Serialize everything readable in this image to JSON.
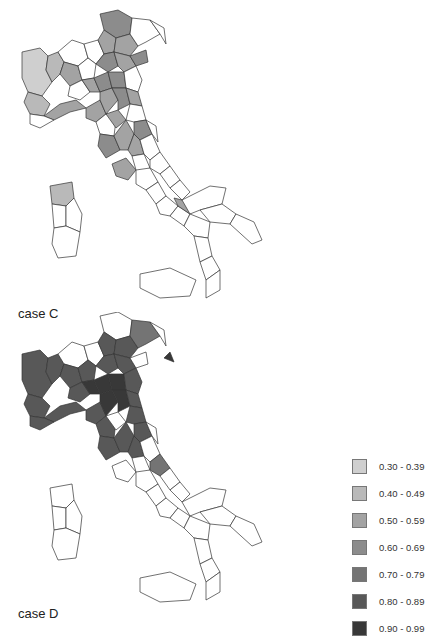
{
  "figure": {
    "panels": [
      {
        "id": "C",
        "label": "case C"
      },
      {
        "id": "D",
        "label": "case D"
      }
    ]
  },
  "legend": {
    "items": [
      {
        "label": "0.30 - 0.39",
        "color": "#cfcfcf"
      },
      {
        "label": "0.40 - 0.49",
        "color": "#b9b9b9"
      },
      {
        "label": "0.50 - 0.59",
        "color": "#a3a3a3"
      },
      {
        "label": "0.60 - 0.69",
        "color": "#8c8c8c"
      },
      {
        "label": "0.70 - 0.79",
        "color": "#747474"
      },
      {
        "label": "0.80 - 0.89",
        "color": "#585858"
      },
      {
        "label": "0.90 - 0.99",
        "color": "#383838"
      }
    ]
  },
  "map_colors": {
    "none": "#ffffff",
    "border": "#333333"
  }
}
